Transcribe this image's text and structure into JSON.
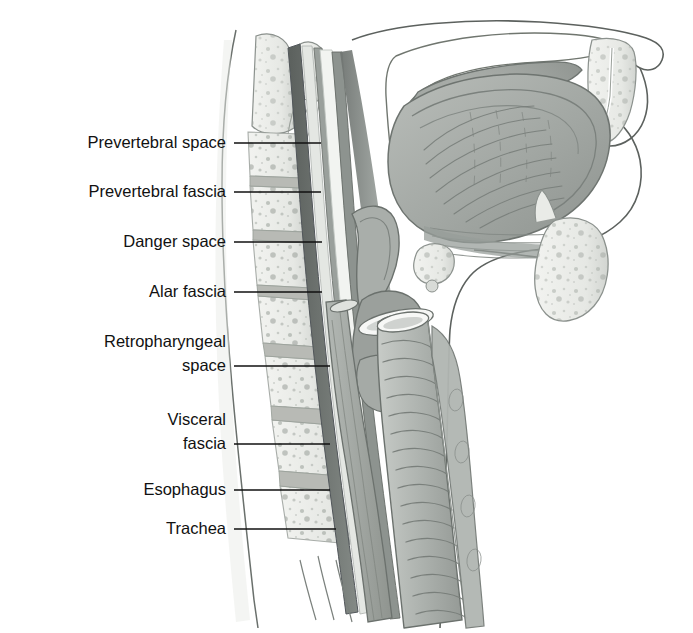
{
  "figure": {
    "kind": "anatomical-illustration",
    "view": "midsagittal section of head and neck",
    "background_color": "#ffffff",
    "line_color": "#111111",
    "style": "grayscale medical line-and-wash drawing"
  },
  "labels": [
    {
      "id": "prevertebral-space",
      "text": "Prevertebral space",
      "text_x": 226,
      "text_y": 148,
      "align": "end",
      "leader": {
        "x1": 234,
        "y1": 143,
        "x2": 321,
        "y2": 143
      },
      "multiline": false
    },
    {
      "id": "prevertebral-fascia",
      "text": "Prevertebral fascia",
      "text_x": 226,
      "text_y": 197,
      "align": "end",
      "leader": {
        "x1": 234,
        "y1": 192,
        "x2": 321,
        "y2": 192
      },
      "multiline": false
    },
    {
      "id": "danger-space",
      "text": "Danger space",
      "text_x": 226,
      "text_y": 247,
      "align": "end",
      "leader": {
        "x1": 234,
        "y1": 242,
        "x2": 322,
        "y2": 242
      },
      "multiline": false
    },
    {
      "id": "alar-fascia",
      "text": "Alar fascia",
      "text_x": 226,
      "text_y": 297,
      "align": "end",
      "leader": {
        "x1": 234,
        "y1": 292,
        "x2": 322,
        "y2": 292
      },
      "multiline": false
    },
    {
      "id": "retropharyngeal-space",
      "text": "Retropharyngeal space",
      "line1": "Retropharyngeal",
      "line2": "space",
      "text_x": 226,
      "text_y": 347,
      "line2_y": 371,
      "align": "end",
      "leader": {
        "x1": 234,
        "y1": 366,
        "x2": 330,
        "y2": 366
      },
      "multiline": true
    },
    {
      "id": "visceral-fascia",
      "text": "Visceral fascia",
      "line1": "Visceral",
      "line2": "fascia",
      "text_x": 226,
      "text_y": 425,
      "line2_y": 449,
      "align": "end",
      "leader": {
        "x1": 234,
        "y1": 444,
        "x2": 330,
        "y2": 444
      },
      "multiline": true
    },
    {
      "id": "esophagus",
      "text": "Esophagus",
      "text_x": 226,
      "text_y": 495,
      "align": "end",
      "leader": {
        "x1": 234,
        "y1": 490,
        "x2": 330,
        "y2": 490
      },
      "multiline": false
    },
    {
      "id": "trachea",
      "text": "Trachea",
      "text_x": 226,
      "text_y": 534,
      "align": "end",
      "leader": {
        "x1": 234,
        "y1": 529,
        "x2": 336,
        "y2": 529
      },
      "multiline": false
    }
  ],
  "anatomy": {
    "structures": [
      "cervical vertebral bodies",
      "intervertebral discs",
      "clivus",
      "odontoid process",
      "prevertebral fascia",
      "alar fascia",
      "visceral (buccopharyngeal) fascia",
      "nasopharynx",
      "oropharynx",
      "hard palate",
      "soft palate",
      "tongue",
      "mandible",
      "hyoid bone",
      "epiglottis",
      "larynx",
      "thyroid cartilage",
      "cricoid cartilage",
      "trachea with cartilage rings",
      "esophagus",
      "upper lip",
      "chin and neck skin outline"
    ]
  },
  "colors": {
    "bone_fill": "#eceeea",
    "bone_stipple": "#9aa09a",
    "disc_fill": "#b8bab5",
    "fascia_dark": "#6e7370",
    "fascia_mid": "#9ba19d",
    "fascia_light": "#c9cdc9",
    "soft_tissue": "#a8ada9",
    "muscle_shade": "#8d938f",
    "airway": "#ffffff",
    "outline": "#5c615e",
    "leader_line": "#111111",
    "label_text": "#111111"
  }
}
